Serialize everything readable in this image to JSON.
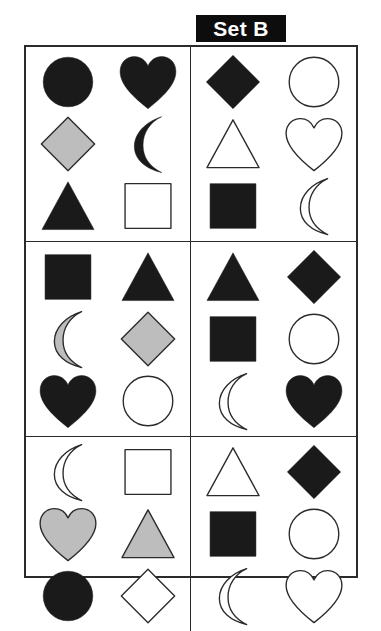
{
  "title": {
    "label": "Set B"
  },
  "colors": {
    "black": "#1a1a1a",
    "gray": "#bdbdbd",
    "white": "#ffffff",
    "outline": "#2b2b2b",
    "badge_bg": "#0d0d0d",
    "badge_text": "#ffffff",
    "page_bg": "#ffffff"
  },
  "grid": {
    "panel_rows": 3,
    "panel_cols": 2,
    "shape_rows": 3,
    "shape_cols": 2
  },
  "panels": [
    {
      "position": "top-left",
      "index": 1,
      "shapes": [
        {
          "shape": "circle",
          "fill": "black",
          "name": "black-circle"
        },
        {
          "shape": "heart",
          "fill": "black",
          "name": "black-heart"
        },
        {
          "shape": "diamond",
          "fill": "gray",
          "name": "gray-diamond"
        },
        {
          "shape": "crescent",
          "fill": "black",
          "name": "black-crescent"
        },
        {
          "shape": "triangle",
          "fill": "black",
          "name": "black-triangle"
        },
        {
          "shape": "square",
          "fill": "white",
          "name": "white-square"
        }
      ]
    },
    {
      "position": "top-right",
      "index": 2,
      "shapes": [
        {
          "shape": "diamond",
          "fill": "black",
          "name": "black-diamond"
        },
        {
          "shape": "circle",
          "fill": "white",
          "name": "white-circle"
        },
        {
          "shape": "triangle",
          "fill": "white",
          "name": "white-triangle"
        },
        {
          "shape": "heart",
          "fill": "white",
          "name": "white-heart"
        },
        {
          "shape": "square",
          "fill": "black",
          "name": "black-square"
        },
        {
          "shape": "crescent",
          "fill": "white",
          "name": "white-crescent"
        }
      ]
    },
    {
      "position": "middle-left",
      "index": 3,
      "shapes": [
        {
          "shape": "square",
          "fill": "black",
          "name": "black-square"
        },
        {
          "shape": "triangle",
          "fill": "black",
          "name": "black-triangle"
        },
        {
          "shape": "crescent",
          "fill": "gray",
          "name": "gray-crescent"
        },
        {
          "shape": "diamond",
          "fill": "gray",
          "name": "gray-diamond"
        },
        {
          "shape": "heart",
          "fill": "black",
          "name": "black-heart"
        },
        {
          "shape": "circle",
          "fill": "white",
          "name": "white-circle"
        }
      ]
    },
    {
      "position": "middle-right",
      "index": 4,
      "shapes": [
        {
          "shape": "triangle",
          "fill": "black",
          "name": "black-triangle"
        },
        {
          "shape": "diamond",
          "fill": "black",
          "name": "black-diamond"
        },
        {
          "shape": "square",
          "fill": "black",
          "name": "black-square"
        },
        {
          "shape": "circle",
          "fill": "white",
          "name": "white-circle"
        },
        {
          "shape": "crescent",
          "fill": "white",
          "name": "white-crescent"
        },
        {
          "shape": "heart",
          "fill": "black",
          "name": "black-heart"
        }
      ]
    },
    {
      "position": "bottom-left",
      "index": 5,
      "shapes": [
        {
          "shape": "crescent",
          "fill": "white",
          "name": "white-crescent"
        },
        {
          "shape": "square",
          "fill": "white",
          "name": "white-square"
        },
        {
          "shape": "heart",
          "fill": "gray",
          "name": "gray-heart"
        },
        {
          "shape": "triangle",
          "fill": "gray",
          "name": "gray-triangle"
        },
        {
          "shape": "circle",
          "fill": "black",
          "name": "black-circle"
        },
        {
          "shape": "diamond",
          "fill": "white",
          "name": "white-diamond"
        }
      ]
    },
    {
      "position": "bottom-right",
      "index": 6,
      "shapes": [
        {
          "shape": "triangle",
          "fill": "white",
          "name": "white-triangle"
        },
        {
          "shape": "diamond",
          "fill": "black",
          "name": "black-diamond"
        },
        {
          "shape": "square",
          "fill": "black",
          "name": "black-square"
        },
        {
          "shape": "circle",
          "fill": "white",
          "name": "white-circle"
        },
        {
          "shape": "crescent",
          "fill": "white",
          "name": "white-crescent"
        },
        {
          "shape": "heart",
          "fill": "white",
          "name": "white-heart"
        }
      ]
    }
  ]
}
